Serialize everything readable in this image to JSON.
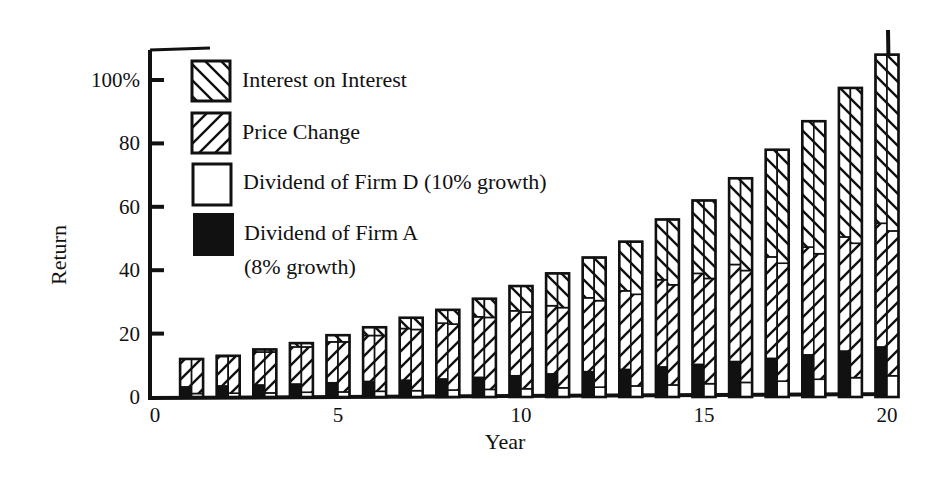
{
  "chart_data": {
    "type": "bar",
    "stacked": true,
    "title": "",
    "xlabel": "Year",
    "ylabel": "Return",
    "ylim": [
      0,
      110
    ],
    "xlim": [
      0,
      21
    ],
    "yticks": [
      {
        "value": 0,
        "label": "0"
      },
      {
        "value": 20,
        "label": "20"
      },
      {
        "value": 40,
        "label": "40"
      },
      {
        "value": 60,
        "label": "60"
      },
      {
        "value": 80,
        "label": "80"
      },
      {
        "value": 100,
        "label": "100%"
      }
    ],
    "xticks": [
      {
        "value": 0,
        "label": "0"
      },
      {
        "value": 5,
        "label": "5"
      },
      {
        "value": 10,
        "label": "10"
      },
      {
        "value": 15,
        "label": "15"
      },
      {
        "value": 20,
        "label": "20"
      }
    ],
    "grid": false,
    "legend_position": "upper left",
    "legend": [
      {
        "name": "Interest on Interest",
        "pattern": "back-hatch"
      },
      {
        "name": "Price Change",
        "pattern": "forward-hatch"
      },
      {
        "name": "Dividend of Firm D (10% growth)",
        "pattern": "white"
      },
      {
        "name": "Dividend of Firm A",
        "name_line2": "(8% growth)",
        "pattern": "black"
      }
    ],
    "categories": [
      1,
      2,
      3,
      4,
      5,
      6,
      7,
      8,
      9,
      10,
      11,
      12,
      13,
      14,
      15,
      16,
      17,
      18,
      19,
      20
    ],
    "series": [
      {
        "name": "Firm A — Dividend (8% growth)",
        "half": "left",
        "pattern": "black",
        "values": [
          3.2,
          3.5,
          3.8,
          4.1,
          4.5,
          4.9,
          5.3,
          5.7,
          6.2,
          6.7,
          7.3,
          8,
          8.7,
          9.5,
          10.3,
          11.2,
          12.2,
          13.3,
          14.5,
          15.8
        ]
      },
      {
        "name": "Firm A — Price Change",
        "half": "left",
        "pattern": "forward-hatch",
        "values": [
          8.8,
          9.3,
          10.4,
          11.7,
          12.9,
          14.5,
          16.3,
          17.6,
          19.1,
          20.5,
          21.5,
          23.3,
          24.8,
          27.5,
          28.7,
          30.6,
          32,
          34,
          36,
          39
        ]
      },
      {
        "name": "Firm A — Interest on Interest",
        "half": "left",
        "pattern": "back-hatch",
        "values": [
          0,
          0.2,
          0.8,
          1.2,
          2.1,
          2.6,
          3.4,
          4.2,
          5.7,
          7.8,
          10.2,
          12.7,
          15.5,
          19,
          23,
          27.2,
          33.8,
          39.7,
          47,
          53.2
        ]
      },
      {
        "name": "Firm D — Dividend (10% growth)",
        "half": "right",
        "pattern": "white",
        "values": [
          1.1,
          1.2,
          1.3,
          1.5,
          1.6,
          1.8,
          2,
          2.2,
          2.4,
          2.6,
          2.9,
          3.1,
          3.5,
          3.8,
          4.2,
          4.6,
          5,
          5.6,
          6.1,
          6.7
        ]
      },
      {
        "name": "Firm D — Price Change",
        "half": "right",
        "pattern": "forward-hatch",
        "values": [
          10.9,
          11.7,
          12.9,
          14.3,
          15.8,
          17.6,
          19.3,
          20.8,
          22.7,
          24.2,
          25.3,
          27.3,
          28.9,
          31.6,
          33.2,
          35.3,
          37.2,
          39.6,
          42.4,
          45.7
        ]
      },
      {
        "name": "Firm D — Interest on Interest",
        "half": "right",
        "pattern": "back-hatch",
        "values": [
          0,
          0.1,
          0.8,
          1.2,
          2.1,
          2.6,
          3.7,
          4.5,
          5.9,
          8.2,
          10.8,
          13.6,
          16.6,
          20.6,
          24.6,
          29.1,
          35.8,
          41.8,
          49,
          55.6
        ]
      }
    ],
    "totals": [
      12,
      13,
      15,
      17,
      19.5,
      22,
      25,
      27.5,
      31,
      35,
      39,
      44,
      49,
      56,
      62,
      69,
      78,
      87,
      97.5,
      108
    ]
  }
}
